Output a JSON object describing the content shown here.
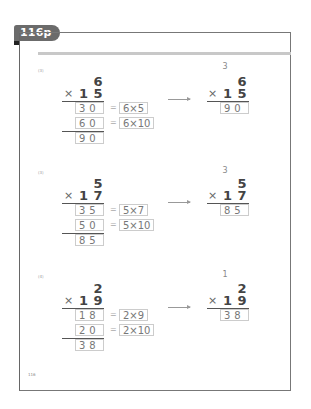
{
  "header": {
    "tab_label": "116p"
  },
  "page_number": "116",
  "problems": [
    {
      "label": "(3)",
      "multiplicand": "6",
      "multiplier": [
        "1",
        "5"
      ],
      "times_sign": "×",
      "partials": [
        {
          "value": "30",
          "expr": "6×5"
        },
        {
          "value": "60",
          "expr": "6×10"
        }
      ],
      "eq_sign": "=",
      "total": "90",
      "carry": "3",
      "short": {
        "multiplicand": "6",
        "multiplier": [
          "1",
          "5"
        ],
        "result": "90"
      }
    },
    {
      "label": "(3)",
      "multiplicand": "5",
      "multiplier": [
        "1",
        "7"
      ],
      "times_sign": "×",
      "partials": [
        {
          "value": "35",
          "expr": "5×7"
        },
        {
          "value": "50",
          "expr": "5×10"
        }
      ],
      "eq_sign": "=",
      "total": "85",
      "carry": "3",
      "short": {
        "multiplicand": "5",
        "multiplier": [
          "1",
          "7"
        ],
        "result": "85"
      }
    },
    {
      "label": "(4)",
      "multiplicand": "2",
      "multiplier": [
        "1",
        "9"
      ],
      "times_sign": "×",
      "partials": [
        {
          "value": "18",
          "expr": "2×9"
        },
        {
          "value": "20",
          "expr": "2×10"
        }
      ],
      "eq_sign": "=",
      "total": "38",
      "carry": "1",
      "short": {
        "multiplicand": "2",
        "multiplier": [
          "1",
          "9"
        ],
        "result": "38"
      }
    }
  ]
}
